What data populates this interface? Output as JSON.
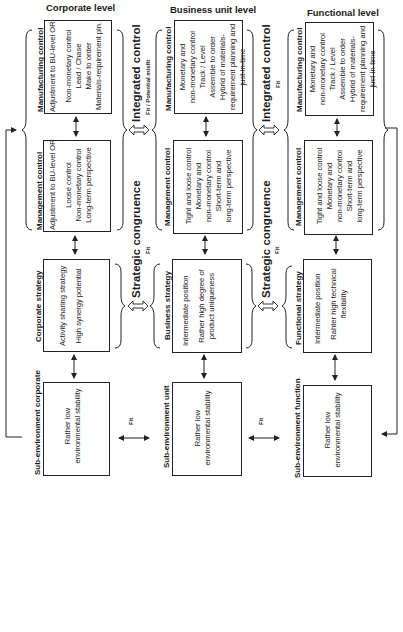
{
  "levels": [
    {
      "title": "Corporate level",
      "manufacturing": {
        "label": "Manufacturing control",
        "lines": [
          "Adjustment to BU-level OR",
          "",
          "Non-monetary control",
          "Lead / Chase",
          "Make to order",
          "Materials-requirement  pln."
        ]
      },
      "management": {
        "label": "Management control",
        "lines": [
          "Adjustment to BU-level OR",
          "",
          "Loose control",
          "Non-monetary control",
          "Long-term perspective"
        ]
      },
      "strategy": {
        "label": "Corporate strategy",
        "lines": [
          "Activity sharing strategy",
          "",
          "High synergy potential"
        ]
      },
      "subenv": {
        "label": "Sub-environment corporate",
        "lines": [
          "Rather low",
          "environmental stability"
        ]
      }
    },
    {
      "title": "Business unit level",
      "manufacturing": {
        "label": "Manufacturing control",
        "lines": [
          "Monetary and",
          "non-monetary control",
          "Track / Level",
          "Assemble to order",
          "Hybrid of materials-",
          "requirement planning and",
          "just-in-time"
        ]
      },
      "management": {
        "label": "Management control",
        "lines": [
          "Tight and loose control",
          "Monetary and",
          "non-monetary control",
          "Short-term and",
          "long-term perspective"
        ]
      },
      "strategy": {
        "label": "Business strategy",
        "lines": [
          "Intermediate position",
          "",
          "Rather high degree of",
          "product uniqueness"
        ]
      },
      "subenv": {
        "label": "Sub-environment unit",
        "lines": [
          "Rather low",
          "environmental stability"
        ]
      }
    },
    {
      "title": "Functional level",
      "manufacturing": {
        "label": "Manufacturing control",
        "lines": [
          "Monetary and",
          "non-monetary control",
          "Track / Level",
          "Assemble to order",
          "Hybrid of materials-",
          "requirement planning and",
          "just-in-time"
        ]
      },
      "management": {
        "label": "Management control",
        "lines": [
          "Tight and loose control",
          "Monetary and",
          "non-monetary control",
          "Short-term and",
          "long-term perspective"
        ]
      },
      "strategy": {
        "label": "Functional strategy",
        "lines": [
          "Intermediate position",
          "",
          "Rahter high technical",
          "flexibility"
        ]
      },
      "subenv": {
        "label": "Sub-environment function",
        "lines": [
          "Rather low",
          "environmental stability"
        ]
      }
    }
  ],
  "links": [
    {
      "integrated": {
        "title": "Integrated control",
        "sub": "Fit / Potential misfit"
      },
      "congruence": {
        "title": "Strategic congruence",
        "sub": "Fit"
      },
      "env_fit": "Fit"
    },
    {
      "integrated": {
        "title": "Integrated control",
        "sub": "Fit"
      },
      "congruence": {
        "title": "Strategic congruence",
        "sub": "Fit"
      },
      "env_fit": "Fit"
    }
  ],
  "colors": {
    "line": "#222222",
    "background": "#ffffff"
  }
}
